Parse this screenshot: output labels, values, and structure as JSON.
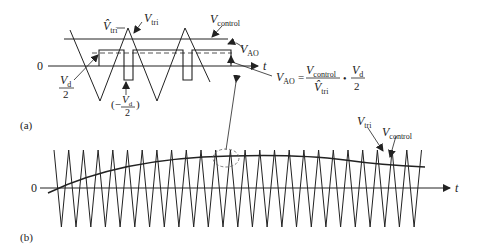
{
  "panel_a": {
    "tag": "(a)",
    "zero_label": "0",
    "axis_label": "t",
    "labels": {
      "vtri_peak": {
        "main": "V̂",
        "sub": "tri"
      },
      "vtri": {
        "main": "V",
        "sub": "tri"
      },
      "vcontrol": {
        "main": "V",
        "sub": "control"
      },
      "vao": {
        "main": "V",
        "sub": "AO"
      },
      "vd_half_num": "V",
      "vd_half_sub": "d",
      "vd_half_den": "2",
      "neg_vd_open": "(−",
      "neg_vd_close": ")",
      "neg_vd_num": "V",
      "neg_vd_sub": "d",
      "neg_vd_den": "2"
    },
    "formula": {
      "lhs_main": "V",
      "lhs_sub": "AO",
      "equals": "=",
      "num_main": "V",
      "num_sub": "control",
      "den_main": "V̂",
      "den_sub": "tri",
      "dot": "•",
      "frac2_num_main": "V",
      "frac2_num_sub": "d",
      "frac2_den": "2"
    }
  },
  "panel_b": {
    "tag": "(b)",
    "zero_label": "0",
    "axis_label": "t",
    "labels": {
      "vtri": {
        "main": "V",
        "sub": "tri"
      },
      "vcontrol": {
        "main": "V",
        "sub": "control"
      }
    }
  },
  "colors": {
    "stroke": "#222222",
    "dashed": "#555555",
    "callout": "#888888"
  }
}
